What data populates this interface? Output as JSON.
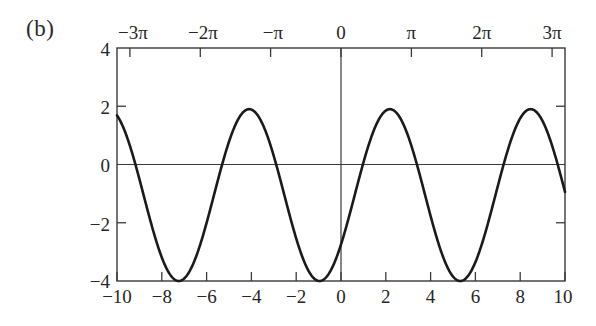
{
  "figure": {
    "panel_label": "(b)",
    "background": "#ffffff",
    "curve_color": "#1a1a1a",
    "axis_color": "#3a3a3a"
  },
  "chart_data": {
    "type": "line",
    "title": "",
    "xlabel": "",
    "ylabel": "",
    "xlim": [
      -10,
      10
    ],
    "ylim": [
      -4,
      4
    ],
    "grid": false,
    "legend": null,
    "axes": {
      "bottom": {
        "tick_values": [
          -10,
          -8,
          -6,
          -4,
          -2,
          0,
          2,
          4,
          6,
          8,
          10
        ],
        "tick_labels": [
          "−10",
          "−8",
          "−6",
          "−4",
          "−2",
          "0",
          "2",
          "4",
          "6",
          "8",
          "10"
        ]
      },
      "top": {
        "tick_values": [
          -9.42477796,
          -6.28318531,
          -3.14159265,
          0,
          3.14159265,
          6.28318531,
          9.42477796
        ],
        "tick_labels": [
          "−3π",
          "−2π",
          "−π",
          "0",
          "π",
          "2π",
          "3π"
        ]
      },
      "left": {
        "tick_values": [
          4,
          2,
          0,
          -2,
          -4
        ],
        "tick_labels": [
          "4",
          "2",
          "0",
          "−2",
          "−4"
        ]
      },
      "right": {
        "tick_values": [
          2,
          -2
        ]
      }
    },
    "zero_line_y": 0,
    "zero_line_x": 0,
    "series": [
      {
        "name": "curve",
        "description": "sinusoid, amplitude 2.95, midline -1.05, period 2pi, peaks near x = -4.1, 2.2, 8.4",
        "amplitude": 2.95,
        "midline": -1.05,
        "period": 6.2832,
        "peak_x": [
          -4.1,
          2.2,
          8.4
        ],
        "peak_y": [
          1.9,
          1.9,
          1.9
        ],
        "min_x": [
          -7.25,
          -0.95,
          5.3
        ],
        "min_y": [
          -4.0,
          -4.0,
          -4.0
        ],
        "x": [
          -10,
          -9.5,
          -9,
          -8.5,
          -8,
          -7.5,
          -7,
          -6.5,
          -6,
          -5.5,
          -5,
          -4.5,
          -4,
          -3.5,
          -3,
          -2.5,
          -2,
          -1.5,
          -1,
          -0.5,
          0,
          0.5,
          1,
          1.5,
          2,
          2.5,
          3,
          3.5,
          4,
          4.5,
          5,
          5.5,
          6,
          6.5,
          7,
          7.5,
          8,
          8.5,
          9,
          9.5,
          10
        ],
        "y": [
          1.6,
          0.55,
          -0.75,
          -2.05,
          -3.1,
          -3.8,
          -4.0,
          -3.7,
          -2.95,
          -1.85,
          -0.55,
          0.75,
          1.65,
          1.9,
          1.5,
          0.5,
          -0.8,
          -2.1,
          -3.15,
          -3.85,
          -4.0,
          -3.65,
          -2.85,
          -1.7,
          -0.4,
          0.9,
          1.75,
          1.9,
          1.45,
          0.4,
          -0.9,
          -2.2,
          -3.25,
          -3.9,
          -3.95,
          -3.55,
          -2.75,
          -1.6,
          -0.25,
          1.0,
          1.8
        ]
      }
    ]
  }
}
